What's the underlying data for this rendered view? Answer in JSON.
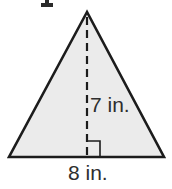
{
  "figure": {
    "type": "geometry-diagram",
    "shape": "triangle",
    "triangle": {
      "height_label": "7 in.",
      "base_label": "8 in."
    },
    "colors": {
      "fill": "#ebebeb",
      "stroke": "#1c1c1c",
      "label": "#2e2e2e",
      "background": "#ffffff"
    }
  }
}
